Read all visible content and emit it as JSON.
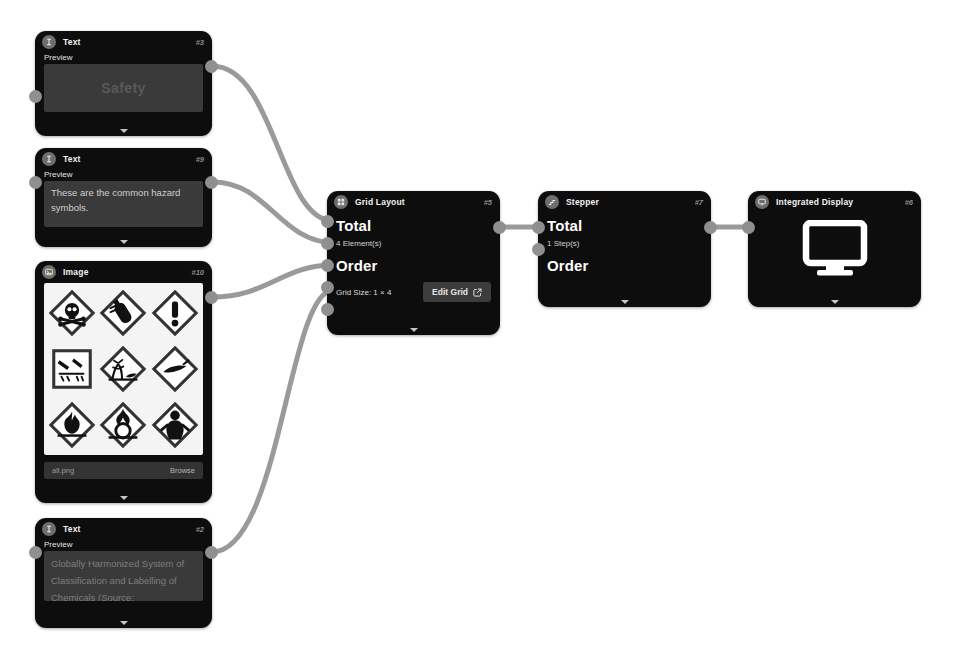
{
  "canvas": {
    "background": "#ffffff",
    "edge_color": "#9a9a9a",
    "port_color": "#8f8f8f",
    "node_color": "#0d0d0d"
  },
  "nodes": [
    {
      "key": "text_safety",
      "type": "Text",
      "title": "Text",
      "id": "#3",
      "icon": "text-cursor-icon",
      "row_label": "Preview",
      "preview_text": "Safety",
      "ports": {
        "inputs": 1,
        "outputs": 1
      }
    },
    {
      "key": "text_hazard",
      "type": "Text",
      "title": "Text",
      "id": "#9",
      "icon": "text-cursor-icon",
      "row_label": "Preview",
      "preview_text": "These are the common hazard symbols.",
      "ports": {
        "inputs": 1,
        "outputs": 1
      }
    },
    {
      "key": "image_all",
      "type": "Image",
      "title": "Image",
      "id": "#10",
      "icon": "image-icon",
      "file_name": "all.png",
      "browse_label": "Browse",
      "pictograms": [
        "skull-crossbones",
        "gas-cylinder",
        "exclamation-mark",
        "corrosion",
        "environment",
        "explosive-bomb",
        "flame",
        "oxidizer",
        "health-hazard"
      ],
      "ports": {
        "inputs": 0,
        "outputs": 1
      }
    },
    {
      "key": "text_ghs",
      "type": "Text",
      "title": "Text",
      "id": "#2",
      "icon": "text-cursor-icon",
      "row_label": "Preview",
      "preview_text": "Globally Harmonized System of Classification and Labelling of Chemicals (Source:",
      "ports": {
        "inputs": 1,
        "outputs": 1
      }
    },
    {
      "key": "grid_layout",
      "type": "Grid Layout",
      "title": "Grid Layout",
      "id": "#5",
      "icon": "grid-icon",
      "total_label": "Total",
      "total_value": "4 Element(s)",
      "order_label": "Order",
      "grid_size_label": "Grid Size: 1 × 4",
      "edit_button_label": "Edit Grid",
      "edit_button_icon": "external-link-icon",
      "ports": {
        "inputs": 5,
        "outputs": 1
      }
    },
    {
      "key": "stepper",
      "type": "Stepper",
      "title": "Stepper",
      "id": "#7",
      "icon": "stepper-icon",
      "total_label": "Total",
      "total_value": "1 Step(s)",
      "order_label": "Order",
      "ports": {
        "inputs": 2,
        "outputs": 1
      }
    },
    {
      "key": "integrated_display",
      "type": "Integrated Display",
      "title": "Integrated Display",
      "id": "#6",
      "icon": "monitor-icon",
      "display_icon": "monitor-icon",
      "ports": {
        "inputs": 1,
        "outputs": 0
      }
    }
  ],
  "edges": [
    {
      "from": "text_safety",
      "to": "grid_layout"
    },
    {
      "from": "text_hazard",
      "to": "grid_layout"
    },
    {
      "from": "image_all",
      "to": "grid_layout"
    },
    {
      "from": "text_ghs",
      "to": "grid_layout"
    },
    {
      "from": "grid_layout",
      "to": "stepper"
    },
    {
      "from": "stepper",
      "to": "integrated_display"
    }
  ]
}
